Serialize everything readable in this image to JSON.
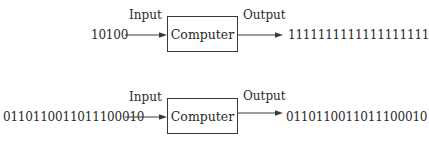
{
  "figure": {
    "diagrams": [
      {
        "input_value": "10100",
        "input_label": "Input",
        "box_label": "Computer",
        "output_label": "Output",
        "output_value": "1111111111111111111"
      },
      {
        "input_value": "0110110011011100010",
        "input_label": "Input",
        "box_label": "Computer",
        "output_label": "Output",
        "output_value": "0110110011011100010"
      }
    ],
    "colors": {
      "line": "#3a3a3a",
      "text": "#2a2a2a",
      "background": "#ffffff"
    }
  }
}
